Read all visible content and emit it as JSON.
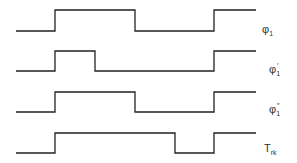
{
  "diagram": {
    "type": "timing-diagram",
    "signals": [
      {
        "name": "phi1",
        "symbol": "φ",
        "subscript": "1",
        "prime": "",
        "edges": [
          55,
          135,
          214
        ],
        "initial": "low"
      },
      {
        "name": "phi1-prime",
        "symbol": "φ",
        "subscript": "1",
        "prime": "′",
        "edges": [
          55,
          95,
          214
        ],
        "initial": "low"
      },
      {
        "name": "phi1-double-prime",
        "symbol": "φ",
        "subscript": "1",
        "prime": "″",
        "edges": [
          55,
          135,
          214
        ],
        "initial": "low"
      },
      {
        "name": "trk",
        "symbol": "T",
        "subscript": "rk",
        "prime": "",
        "edges": [
          55,
          175,
          214
        ],
        "initial": "low"
      }
    ],
    "labels": {
      "phi1": {
        "main": "φ",
        "sub": "1",
        "prime": ""
      },
      "phi1p": {
        "main": "φ",
        "sub": "1",
        "prime": "′"
      },
      "phi1pp": {
        "main": "φ",
        "sub": "1",
        "prime": "″"
      },
      "trk": {
        "main": "T",
        "sub": "rk",
        "prime": ""
      }
    },
    "colors": {
      "line": "#222222",
      "text": "#333333",
      "background": "#ffffff"
    }
  }
}
